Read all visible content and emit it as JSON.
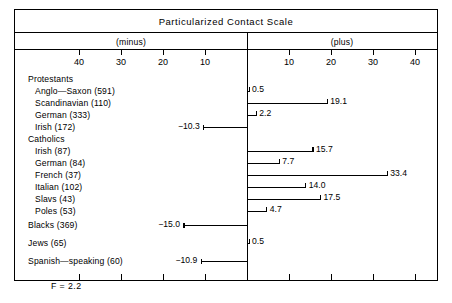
{
  "figure": {
    "title": "Particularized Contact Scale",
    "sign_minus": "(minus)",
    "sign_plus": "(plus)",
    "f_statistic": "F = 2.2"
  },
  "axis": {
    "minus_ticks": [
      "40",
      "30",
      "20",
      "10"
    ],
    "plus_ticks": [
      "10",
      "20",
      "30",
      "40"
    ],
    "minus_values": [
      -40,
      -30,
      -20,
      -10
    ],
    "plus_values": [
      10,
      20,
      30,
      40
    ],
    "px_per_unit": 4.2,
    "zero_x_px": 232
  },
  "chart_data": {
    "type": "bar",
    "orientation": "horizontal-diverging",
    "title": "Particularized Contact Scale",
    "xlabel": "",
    "ylabel": "",
    "xlim": [
      -45,
      45
    ],
    "grid": false,
    "legend": null,
    "annotations": [
      "F = 2.2",
      "(minus)",
      "(plus)"
    ],
    "categories": [
      "Protestants",
      "Anglo—Saxon (591)",
      "Scandinavian (110)",
      "German (333)",
      "Irish (172)",
      "Catholics",
      "Irish (87)",
      "German (84)",
      "French (37)",
      "Italian (102)",
      "Slavs (43)",
      "Poles (53)",
      "Blacks (369)",
      "Jews (65)",
      "Spanish—speaking (60)"
    ],
    "values": [
      null,
      0.5,
      19.1,
      2.2,
      -10.3,
      null,
      15.7,
      7.7,
      33.4,
      14.0,
      17.5,
      4.7,
      -15.0,
      0.5,
      -10.9
    ]
  },
  "rows": [
    {
      "label": "Protestants",
      "indent": 0,
      "value": null,
      "value_text": "",
      "top": 0
    },
    {
      "label": "Anglo—Saxon (591)",
      "indent": 1,
      "value": 0.5,
      "value_text": "0.5",
      "top": 12
    },
    {
      "label": "Scandinavian (110)",
      "indent": 1,
      "value": 19.1,
      "value_text": "19.1",
      "top": 24
    },
    {
      "label": "German (333)",
      "indent": 1,
      "value": 2.2,
      "value_text": "2.2",
      "top": 36
    },
    {
      "label": "Irish (172)",
      "indent": 1,
      "value": -10.3,
      "value_text": "−10.3",
      "top": 48
    },
    {
      "label": "Catholics",
      "indent": 0,
      "value": null,
      "value_text": "",
      "top": 60
    },
    {
      "label": "Irish (87)",
      "indent": 1,
      "value": 15.7,
      "value_text": "15.7",
      "top": 72
    },
    {
      "label": "German (84)",
      "indent": 1,
      "value": 7.7,
      "value_text": "7.7",
      "top": 84
    },
    {
      "label": "French (37)",
      "indent": 1,
      "value": 33.4,
      "value_text": "33.4",
      "top": 96
    },
    {
      "label": "Italian (102)",
      "indent": 1,
      "value": 14.0,
      "value_text": "14.0",
      "top": 108
    },
    {
      "label": "Slavs (43)",
      "indent": 1,
      "value": 17.5,
      "value_text": "17.5",
      "top": 120
    },
    {
      "label": "Poles (53)",
      "indent": 1,
      "value": 4.7,
      "value_text": "4.7",
      "top": 132
    },
    {
      "label": "Blacks (369)",
      "indent": 0,
      "value": -15.0,
      "value_text": "−15.0",
      "top": 146
    },
    {
      "label": "Jews (65)",
      "indent": 0,
      "value": 0.5,
      "value_text": "0.5",
      "top": 164
    },
    {
      "label": "Spanish—speaking (60)",
      "indent": 0,
      "value": -10.9,
      "value_text": "−10.9",
      "top": 182
    }
  ]
}
